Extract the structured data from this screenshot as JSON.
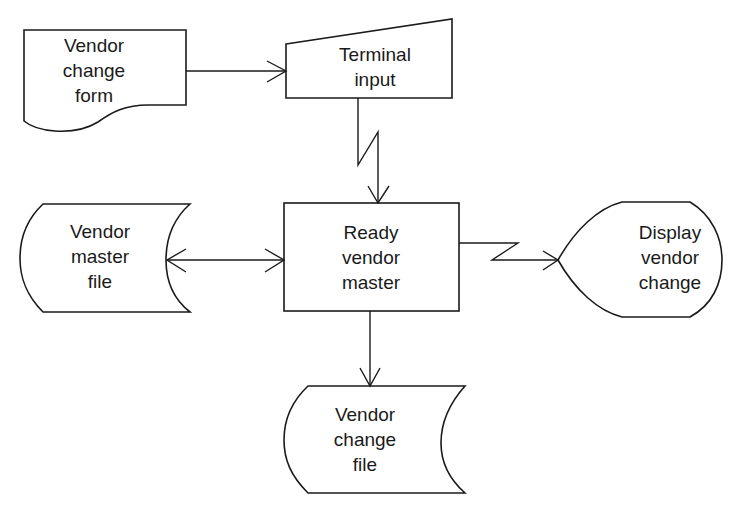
{
  "diagram": {
    "type": "system-flowchart",
    "nodes": [
      {
        "id": "vendor-change-form",
        "shape": "document",
        "label": "Vendor\nchange\nform"
      },
      {
        "id": "terminal-input",
        "shape": "manual-input",
        "label": "Terminal\ninput"
      },
      {
        "id": "vendor-master-file",
        "shape": "stored-data",
        "label": "Vendor\nmaster\nfile"
      },
      {
        "id": "ready-vendor-master",
        "shape": "process",
        "label": "Ready\nvendor\nmaster"
      },
      {
        "id": "display-vendor-change",
        "shape": "display",
        "label": "Display\nvendor\nchange"
      },
      {
        "id": "vendor-change-file",
        "shape": "stored-data",
        "label": "Vendor\nchange\nfile"
      }
    ],
    "edges": [
      {
        "from": "vendor-change-form",
        "to": "terminal-input",
        "style": "arrow"
      },
      {
        "from": "terminal-input",
        "to": "ready-vendor-master",
        "style": "communication-link"
      },
      {
        "from": "vendor-master-file",
        "to": "ready-vendor-master",
        "style": "bidirectional-arrow"
      },
      {
        "from": "ready-vendor-master",
        "to": "display-vendor-change",
        "style": "communication-link"
      },
      {
        "from": "ready-vendor-master",
        "to": "vendor-change-file",
        "style": "arrow"
      }
    ]
  },
  "labels": {
    "vendor_change_form": "Vendor\nchange\nform",
    "terminal_input": "Terminal\ninput",
    "vendor_master_file": "Vendor\nmaster\nfile",
    "ready_vendor_master": "Ready\nvendor\nmaster",
    "display_vendor_change": "Display\nvendor\nchange",
    "vendor_change_file": "Vendor\nchange\nfile"
  },
  "colors": {
    "stroke": "#1a1a1a",
    "background": "#ffffff"
  }
}
